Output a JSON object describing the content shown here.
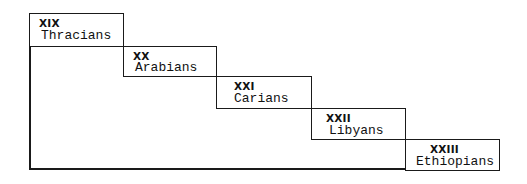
{
  "diagram": {
    "type": "staircase",
    "steps": [
      {
        "numeral": "XIX",
        "label": "Thracians"
      },
      {
        "numeral": "XX",
        "label": "Arabians"
      },
      {
        "numeral": "XXI",
        "label": "Carians"
      },
      {
        "numeral": "XXII",
        "label": "Libyans"
      },
      {
        "numeral": "XXIII",
        "label": "Ethiopians"
      }
    ]
  }
}
